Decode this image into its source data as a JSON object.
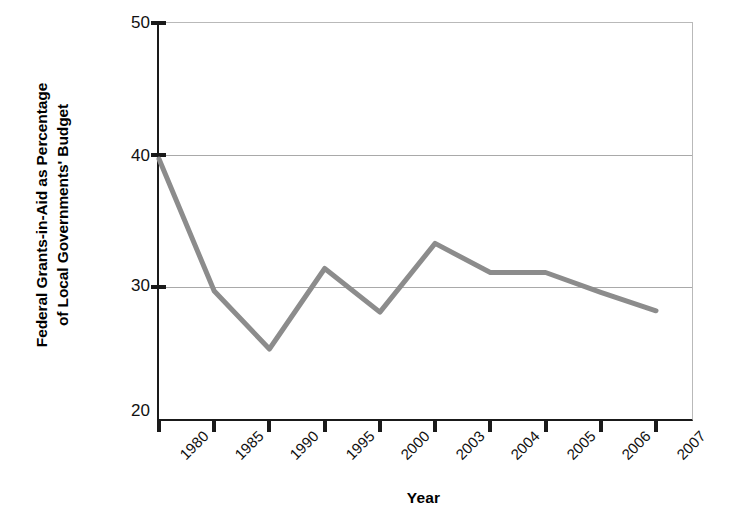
{
  "chart_data": {
    "type": "line",
    "title": "",
    "xlabel": "Year",
    "ylabel_line1": "Federal Grants-in-Aid as Percentage",
    "ylabel_line2": "of Local Governments' Budget",
    "ylabel": "Federal Grants-in-Aid as Percentage of Local Governments' Budget",
    "categories": [
      "1980",
      "1985",
      "1990",
      "1995",
      "2000",
      "2003",
      "2004",
      "2005",
      "2006",
      "2007"
    ],
    "values": [
      39.7,
      29.7,
      25.3,
      31.4,
      28.1,
      33.3,
      31.1,
      31.1,
      29.6,
      28.2
    ],
    "ylim": [
      20,
      50
    ],
    "yticks": [
      "20",
      "30",
      "40",
      "50"
    ],
    "ytick_values": [
      20,
      30,
      40,
      50
    ],
    "gridlines": [
      30,
      40
    ],
    "grid": true,
    "legend": "none",
    "series_color": "#8c8c8c",
    "axis_color": "#1a1a1a",
    "grid_color": "#a9a9a9"
  }
}
